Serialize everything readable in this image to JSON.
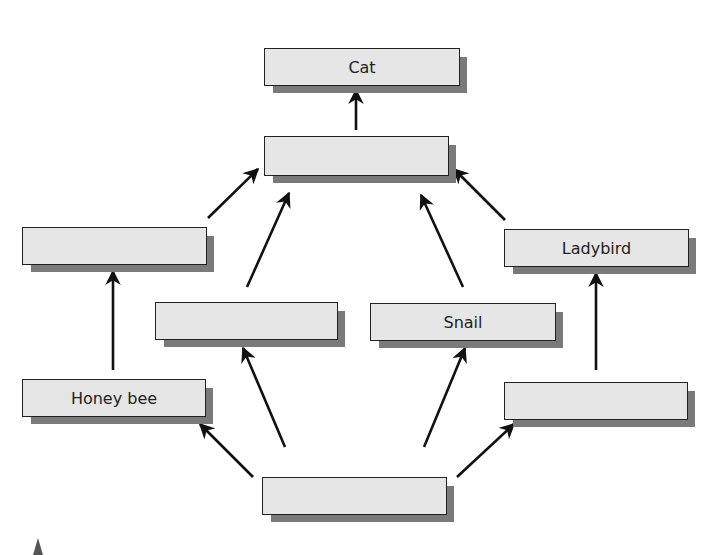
{
  "diagram": {
    "type": "food-web",
    "boxes": [
      {
        "id": "cat",
        "label": "Cat",
        "x": 264,
        "y": 48,
        "w": 196,
        "h": 38
      },
      {
        "id": "hub",
        "label": "",
        "x": 264,
        "y": 136,
        "w": 185,
        "h": 40
      },
      {
        "id": "left-upper",
        "label": "",
        "x": 22,
        "y": 227,
        "w": 185,
        "h": 38
      },
      {
        "id": "ladybird",
        "label": "Ladybird",
        "x": 504,
        "y": 229,
        "w": 185,
        "h": 38
      },
      {
        "id": "mid-left",
        "label": "",
        "x": 155,
        "y": 302,
        "w": 183,
        "h": 38
      },
      {
        "id": "snail",
        "label": "Snail",
        "x": 370,
        "y": 303,
        "w": 186,
        "h": 38
      },
      {
        "id": "honey-bee",
        "label": "Honey bee",
        "x": 22,
        "y": 379,
        "w": 184,
        "h": 38
      },
      {
        "id": "right-lower",
        "label": "",
        "x": 504,
        "y": 382,
        "w": 184,
        "h": 38
      },
      {
        "id": "bottom",
        "label": "",
        "x": 262,
        "y": 477,
        "w": 185,
        "h": 38
      }
    ],
    "arrows": [
      {
        "from": "hub",
        "to": "cat",
        "x1": 356,
        "y1": 130,
        "x2": 356,
        "y2": 90
      },
      {
        "from": "left-upper",
        "to": "hub",
        "x1": 208,
        "y1": 218,
        "x2": 258,
        "y2": 169
      },
      {
        "from": "mid-left",
        "to": "hub",
        "x1": 247,
        "y1": 287,
        "x2": 289,
        "y2": 193
      },
      {
        "from": "snail",
        "to": "hub",
        "x1": 463,
        "y1": 287,
        "x2": 421,
        "y2": 195
      },
      {
        "from": "ladybird",
        "to": "hub",
        "x1": 505,
        "y1": 220,
        "x2": 454,
        "y2": 169
      },
      {
        "from": "honey-bee",
        "to": "left-upper",
        "x1": 113,
        "y1": 370,
        "x2": 113,
        "y2": 271
      },
      {
        "from": "right-lower",
        "to": "ladybird",
        "x1": 596,
        "y1": 370,
        "x2": 596,
        "y2": 273
      },
      {
        "from": "bottom",
        "to": "mid-left",
        "x1": 285,
        "y1": 447,
        "x2": 243,
        "y2": 348
      },
      {
        "from": "bottom",
        "to": "snail",
        "x1": 424,
        "y1": 447,
        "x2": 465,
        "y2": 348
      },
      {
        "from": "bottom",
        "to": "honey-bee",
        "x1": 253,
        "y1": 477,
        "x2": 200,
        "y2": 424
      },
      {
        "from": "bottom",
        "to": "right-lower",
        "x1": 457,
        "y1": 477,
        "x2": 514,
        "y2": 424
      }
    ],
    "colors": {
      "box_fill": "#e6e6e6",
      "box_border": "#222222",
      "shadow": "#7a7a7a",
      "arrow": "#111111"
    }
  }
}
